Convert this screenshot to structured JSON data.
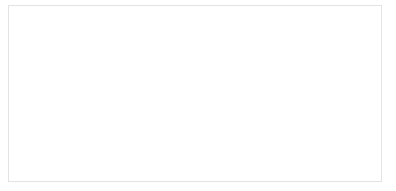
{
  "chart_data": {
    "type": "line",
    "title": "",
    "subtitle": "",
    "xlabel": "",
    "ylabel": "",
    "grid": true,
    "legend": false,
    "legend_position": "none",
    "line_color": "#1a1a1a",
    "grid_color": "#ededed",
    "axis_color": "#b4b4b4",
    "tick_label_color": "#8a8a8a",
    "ylim": [
      0,
      1600000
    ],
    "y_tick_step": 200000,
    "y_ticks": [
      0,
      200000,
      400000,
      600000,
      800000,
      1000000,
      1200000,
      1400000,
      1600000
    ],
    "y_tick_labels": [
      "0",
      "200,000",
      "400,000",
      "600,000",
      "800,000",
      "1,000,000",
      "1,200,000",
      "1,400,000",
      "1,600,000"
    ],
    "x_tick_labels": [
      "Jul",
      "Oct",
      "2020",
      "Apr",
      "Jul",
      "Oct",
      "2021"
    ],
    "x_tick_x": [
      "2019-07",
      "2019-10",
      "2020-01",
      "2020-04",
      "2020-07",
      "2020-10",
      "2021-01"
    ],
    "xlim": [
      "2019-05",
      "2021-02"
    ],
    "x": [
      "2019-05",
      "2019-06",
      "2019-07",
      "2019-08",
      "2019-09",
      "2019-10",
      "2019-11",
      "2019-12",
      "2020-01",
      "2020-02",
      "2020-03",
      "2020-04",
      "2020-05",
      "2020-06",
      "2020-07",
      "2020-08",
      "2020-09",
      "2020-10",
      "2020-11",
      "2020-12",
      "2021-01",
      "2021-02"
    ],
    "series": [
      {
        "name": "Cumulative total",
        "color": "#1a1a1a",
        "values": [
          5000,
          9000,
          14000,
          19000,
          24000,
          30000,
          27000,
          29000,
          31000,
          33000,
          36000,
          52000,
          150000,
          160000,
          172000,
          190000,
          250000,
          330000,
          430000,
          470000,
          1060000,
          1520000
        ]
      }
    ],
    "annotations": [],
    "notes_shape": "Exponential growth curve: flat near zero through 2019, step up around Apr-May 2020 to ~150,000, steady climb through late 2020 to ~450,000, then a steep surge with a plateau/zigzag near 1,000,000-1,100,000 before peaking at ~1,520,000."
  }
}
